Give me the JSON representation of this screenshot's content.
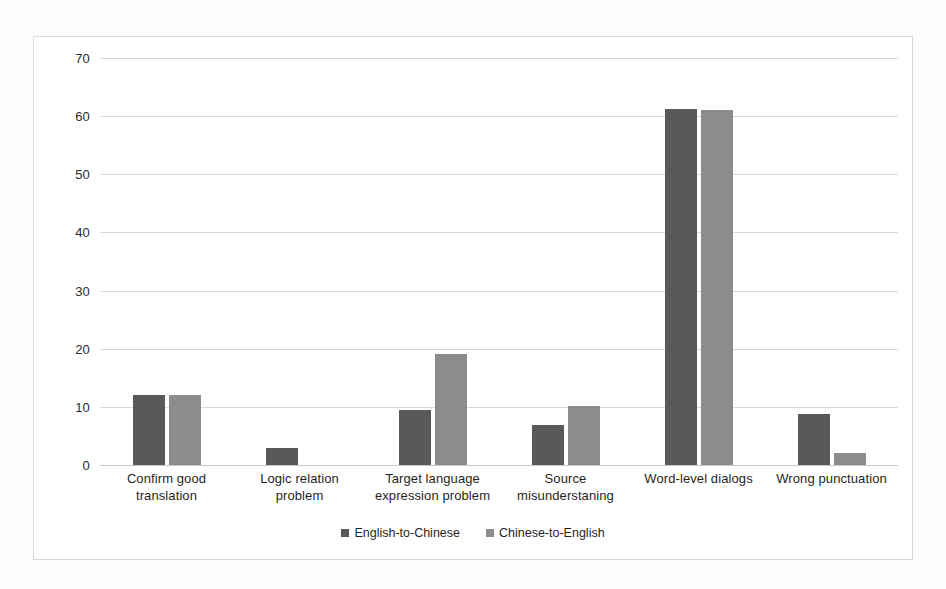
{
  "chart_data": {
    "type": "bar",
    "title": "",
    "subtitle": "",
    "xlabel": "",
    "ylabel": "",
    "ylim": [
      0,
      70
    ],
    "yticks": [
      0,
      10,
      20,
      30,
      40,
      50,
      60,
      70
    ],
    "ytick_labels": [
      "0",
      "10",
      "20",
      "30",
      "40",
      "50",
      "60",
      "70"
    ],
    "grid": true,
    "legend_position": "bottom-center",
    "categories": [
      "Confirm good translation",
      "Logic relation problem",
      "Target language expression problem",
      "Source misunderstaning",
      "Word-level dialogs",
      "Wrong punctuation"
    ],
    "category_lines": [
      [
        "Confirm good",
        "translation"
      ],
      [
        "Logic relation problem"
      ],
      [
        "Target language",
        "expression problem"
      ],
      [
        "Source",
        "misunderstaning"
      ],
      [
        "Word-level dialogs"
      ],
      [
        "Wrong punctuation"
      ]
    ],
    "series": [
      {
        "name": "English-to-Chinese",
        "color": "#595959",
        "values": [
          12.1,
          3.0,
          9.5,
          6.8,
          61.3,
          8.7
        ]
      },
      {
        "name": "Chinese-to-English",
        "color": "#8c8c8c",
        "values": [
          12.1,
          0,
          19.1,
          10.1,
          61.0,
          2.0
        ]
      }
    ]
  },
  "legend": {
    "items": [
      {
        "label": "English-to-Chinese"
      },
      {
        "label": "Chinese-to-English"
      }
    ]
  },
  "colors": {
    "series_english_to_chinese": "#595959",
    "series_chinese_to_english": "#8c8c8c",
    "gridline": "#d9d9d9",
    "frame_border": "#d9d9d9",
    "plot_background": "#ffffff",
    "page_background": "#fdfdfd"
  }
}
